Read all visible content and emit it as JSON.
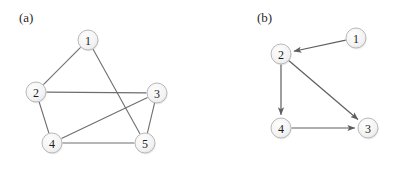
{
  "figure": {
    "width": 403,
    "height": 177,
    "background": "#ffffff"
  },
  "style": {
    "node_fill_light": "#fdfdfd",
    "node_fill_dark": "#e3e3e3",
    "node_stroke": "#b9b9b9",
    "node_radius": 10,
    "edge_color": "#6e6e6e",
    "arrow_color": "#5e5e5e",
    "label_color": "#1c1c1c"
  },
  "panels": [
    {
      "id": "a",
      "label": "(a)",
      "caption_position": {
        "x": 19,
        "y": 10
      },
      "graph_type": "undirected",
      "nodes": [
        {
          "id": "1",
          "label": "1",
          "x": 88,
          "y": 40
        },
        {
          "id": "2",
          "label": "2",
          "x": 36,
          "y": 92
        },
        {
          "id": "3",
          "label": "3",
          "x": 157,
          "y": 93
        },
        {
          "id": "4",
          "label": "4",
          "x": 52,
          "y": 143
        },
        {
          "id": "5",
          "label": "5",
          "x": 145,
          "y": 143
        }
      ],
      "edges": [
        {
          "source": "1",
          "target": "2",
          "directed": false
        },
        {
          "source": "1",
          "target": "5",
          "directed": false
        },
        {
          "source": "2",
          "target": "3",
          "directed": false
        },
        {
          "source": "2",
          "target": "4",
          "directed": false
        },
        {
          "source": "3",
          "target": "4",
          "directed": false
        },
        {
          "source": "3",
          "target": "5",
          "directed": false
        },
        {
          "source": "4",
          "target": "5",
          "directed": false
        }
      ]
    },
    {
      "id": "b",
      "label": "(b)",
      "caption_position": {
        "x": 56,
        "y": 10
      },
      "graph_type": "directed",
      "nodes": [
        {
          "id": "1",
          "label": "1",
          "x": 155,
          "y": 38
        },
        {
          "id": "2",
          "label": "2",
          "x": 80,
          "y": 54
        },
        {
          "id": "3",
          "label": "3",
          "x": 167,
          "y": 128
        },
        {
          "id": "4",
          "label": "4",
          "x": 80,
          "y": 128
        }
      ],
      "edges": [
        {
          "source": "1",
          "target": "2",
          "directed": true
        },
        {
          "source": "2",
          "target": "4",
          "directed": true
        },
        {
          "source": "2",
          "target": "3",
          "directed": true
        },
        {
          "source": "4",
          "target": "3",
          "directed": true
        }
      ]
    }
  ]
}
